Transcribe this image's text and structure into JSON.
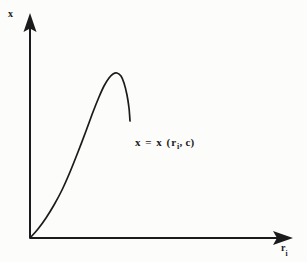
{
  "figure": {
    "background_color": "#fcfcfb",
    "ink_color": "#1b1b1b",
    "y_axis": {
      "label_text": "x",
      "label_subscript": ""
    },
    "x_axis": {
      "label_text": "r",
      "label_subscript": "i"
    },
    "annotation": {
      "prefix": "x = x (r",
      "subscript": "i",
      "suffix": ", c)",
      "full_text": "x = x (r_i, c)"
    }
  },
  "chart_data": {
    "type": "line",
    "title": "",
    "xlabel": "r_i",
    "ylabel": "x",
    "grid": false,
    "legend": false,
    "annotations": [
      {
        "text": "x = x (r_i, c)",
        "x_px": 135,
        "y_px": 137
      }
    ],
    "axes_style": "arrow-tipped open axes, no ticks, no tick labels",
    "origin_px": {
      "x": 30,
      "y": 238
    },
    "x_axis_extent_px": {
      "start": 30,
      "end": 292
    },
    "y_axis_extent_px": {
      "start": 238,
      "end": 14
    },
    "series": [
      {
        "name": "x(r_i, c)",
        "color": "#1b1b1b",
        "linewidth": 1.6,
        "comment": "asymmetric skewed hump: rises slowly, steepens, peaks, then falls sharply and terminates before the axis end",
        "points_px": [
          {
            "x": 30,
            "y": 238
          },
          {
            "x": 38,
            "y": 229
          },
          {
            "x": 46,
            "y": 218
          },
          {
            "x": 54,
            "y": 205
          },
          {
            "x": 62,
            "y": 190
          },
          {
            "x": 70,
            "y": 172
          },
          {
            "x": 78,
            "y": 152
          },
          {
            "x": 86,
            "y": 131
          },
          {
            "x": 93,
            "y": 112
          },
          {
            "x": 99,
            "y": 97
          },
          {
            "x": 104,
            "y": 86
          },
          {
            "x": 109,
            "y": 78
          },
          {
            "x": 113,
            "y": 74
          },
          {
            "x": 117,
            "y": 73
          },
          {
            "x": 121,
            "y": 76
          },
          {
            "x": 124,
            "y": 83
          },
          {
            "x": 127,
            "y": 95
          },
          {
            "x": 129,
            "y": 108
          },
          {
            "x": 130,
            "y": 121
          }
        ],
        "normalized": {
          "x": [
            0.0,
            0.03,
            0.06,
            0.09,
            0.12,
            0.15,
            0.18,
            0.21,
            0.24,
            0.26,
            0.28,
            0.3,
            0.32,
            0.33,
            0.35,
            0.36,
            0.37,
            0.38,
            0.38
          ],
          "y": [
            0.0,
            0.04,
            0.09,
            0.15,
            0.21,
            0.29,
            0.38,
            0.48,
            0.56,
            0.63,
            0.68,
            0.71,
            0.73,
            0.74,
            0.72,
            0.69,
            0.64,
            0.58,
            0.52
          ]
        }
      }
    ]
  }
}
